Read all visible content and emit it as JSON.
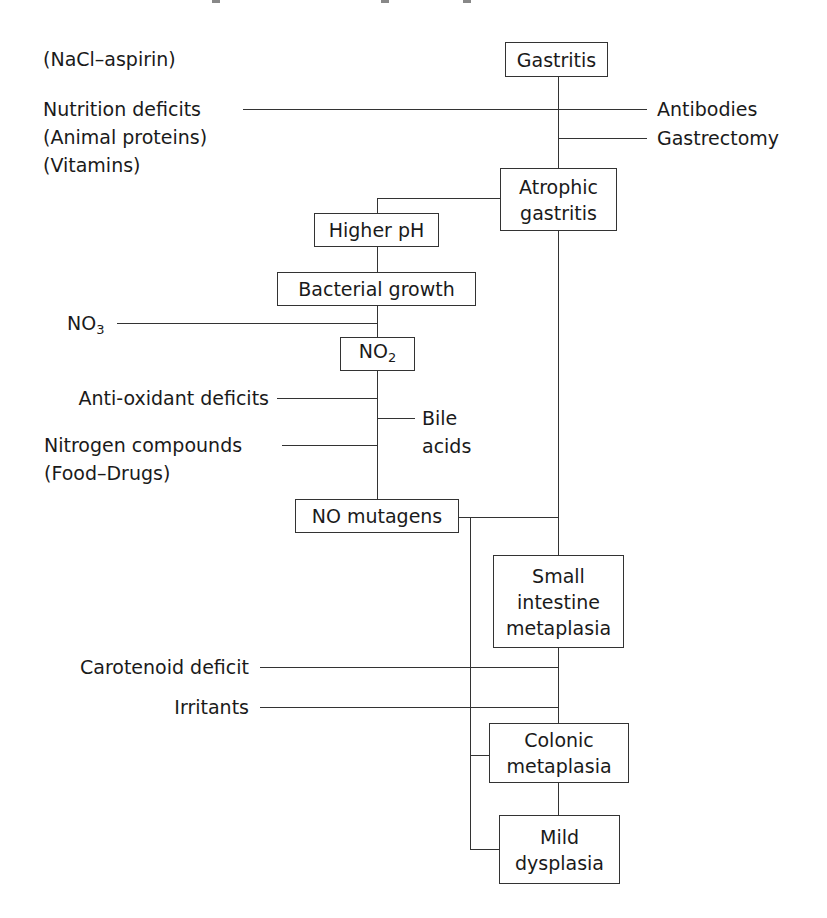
{
  "diagram": {
    "type": "flowchart",
    "topic": "Pathogenesis cascade from gastritis to dysplasia",
    "nodes": {
      "gastritis": "Gastritis",
      "atrophic_gastritis": "Atrophic\ngastritis",
      "higher_ph": "Higher pH",
      "bacterial_growth": "Bacterial growth",
      "no2_base": "NO",
      "no2_sub": "2",
      "no_mutagens": "NO mutagens",
      "small_intestine_metaplasia": "Small\nintestine\nmetaplasia",
      "colonic_metaplasia": "Colonic\nmetaplasia",
      "mild_dysplasia": "Mild\ndysplasia"
    },
    "inputs": {
      "nacl_aspirin": "(NaCl–aspirin)",
      "nutrition_deficits": "Nutrition deficits\n(Animal proteins)\n(Vitamins)",
      "antibodies": "Antibodies",
      "gastrectomy": "Gastrectomy",
      "no3_base": "NO",
      "no3_sub": "3",
      "antioxidant_deficits": "Anti-oxidant deficits",
      "bile_acids": "Bile\nacids",
      "nitrogen_compounds": "Nitrogen compounds\n(Food–Drugs)",
      "carotenoid_deficit": "Carotenoid deficit",
      "irritants": "Irritants"
    },
    "edges": [
      [
        "Gastritis",
        "Atrophic gastritis"
      ],
      [
        "Nutrition deficits",
        "Gastritis→Atrophic gastritis"
      ],
      [
        "Antibodies",
        "Gastritis→Atrophic gastritis"
      ],
      [
        "Gastrectomy",
        "Gastritis→Atrophic gastritis"
      ],
      [
        "Atrophic gastritis",
        "Higher pH"
      ],
      [
        "Higher pH",
        "Bacterial growth"
      ],
      [
        "Bacterial growth",
        "NO2"
      ],
      [
        "NO3",
        "Bacterial growth→NO2"
      ],
      [
        "NO2",
        "NO mutagens"
      ],
      [
        "Anti-oxidant deficits",
        "NO2→NO mutagens"
      ],
      [
        "Bile acids",
        "NO2→NO mutagens"
      ],
      [
        "Nitrogen compounds",
        "NO2→NO mutagens"
      ],
      [
        "Atrophic gastritis",
        "Small intestine metaplasia"
      ],
      [
        "NO mutagens",
        "Atrophic gastritis→Small intestine metaplasia"
      ],
      [
        "NO mutagens",
        "Colonic metaplasia"
      ],
      [
        "NO mutagens",
        "Mild dysplasia"
      ],
      [
        "Small intestine metaplasia",
        "Colonic metaplasia"
      ],
      [
        "Carotenoid deficit",
        "Small intestine→Colonic metaplasia"
      ],
      [
        "Irritants",
        "Small intestine→Colonic metaplasia"
      ],
      [
        "Colonic metaplasia",
        "Mild dysplasia"
      ]
    ]
  }
}
